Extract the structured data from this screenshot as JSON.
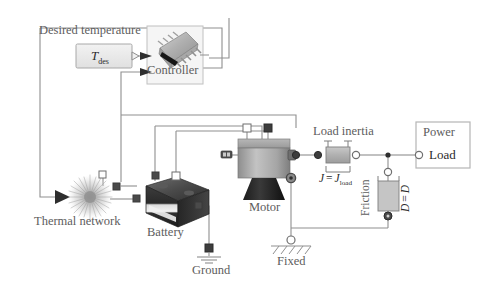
{
  "diagram": {
    "background_color": "#ffffff",
    "wire_color": "#8a8a8a",
    "label_color": "#5d5d5d",
    "label_color_dark": "#2b2b2b",
    "accent_grey": "#b9b9b9"
  },
  "labels": {
    "desired_temperature": "Desired temperature",
    "t_des_symbol": "T",
    "t_des_subscript": "des",
    "controller": "Controller",
    "thermal_network": "Thermal network",
    "battery": "Battery",
    "ground": "Ground",
    "motor": "Motor",
    "fixed": "Fixed",
    "load_inertia": "Load inertia",
    "inertia_equation_lhs": "J",
    "inertia_equation_eq": "=",
    "inertia_equation_rhs": "J",
    "inertia_equation_rhs_sub": "load",
    "friction": "Friction",
    "friction_equation_lhs": "D",
    "friction_equation_eq": "=",
    "friction_equation_rhs": "D",
    "power": "Power",
    "load": "Load"
  },
  "blocks": [
    {
      "name": "t-des-source",
      "label": "T des",
      "type": "source-block"
    },
    {
      "name": "controller",
      "label": "Controller",
      "type": "ic-chip-image"
    },
    {
      "name": "thermal-network",
      "label": "Thermal network",
      "type": "radial-burst-image"
    },
    {
      "name": "battery",
      "label": "Battery",
      "type": "battery-photo"
    },
    {
      "name": "motor",
      "label": "Motor",
      "type": "motor-photo"
    },
    {
      "name": "load-inertia",
      "label": "Load inertia",
      "type": "inertia-element"
    },
    {
      "name": "friction",
      "label": "Friction",
      "type": "damper-element"
    },
    {
      "name": "power-load",
      "label": "Load",
      "type": "subsystem-block"
    },
    {
      "name": "ground",
      "label": "Ground",
      "type": "electrical-ground"
    },
    {
      "name": "fixed",
      "label": "Fixed",
      "type": "mechanical-ground"
    }
  ],
  "ports": {
    "hollow_square": "physical-port-hollow",
    "filled_square": "physical-port-filled",
    "hollow_circle": "mechanical-port-hollow",
    "filled_circle": "mechanical-port-filled",
    "arrow_in": "signal-input-arrow",
    "arrow_out": "signal-output-arrow"
  }
}
